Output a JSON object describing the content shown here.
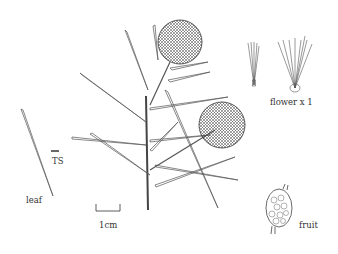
{
  "illustration": {
    "subject": "botanical line drawing of a plant branch with spherical flower heads",
    "labels": {
      "flower": "flower x 1",
      "leaf": "leaf",
      "ts": "TS",
      "scale": "1cm",
      "fruit": "fruit"
    },
    "colors": {
      "ink": "#333333",
      "background": "#ffffff"
    }
  }
}
